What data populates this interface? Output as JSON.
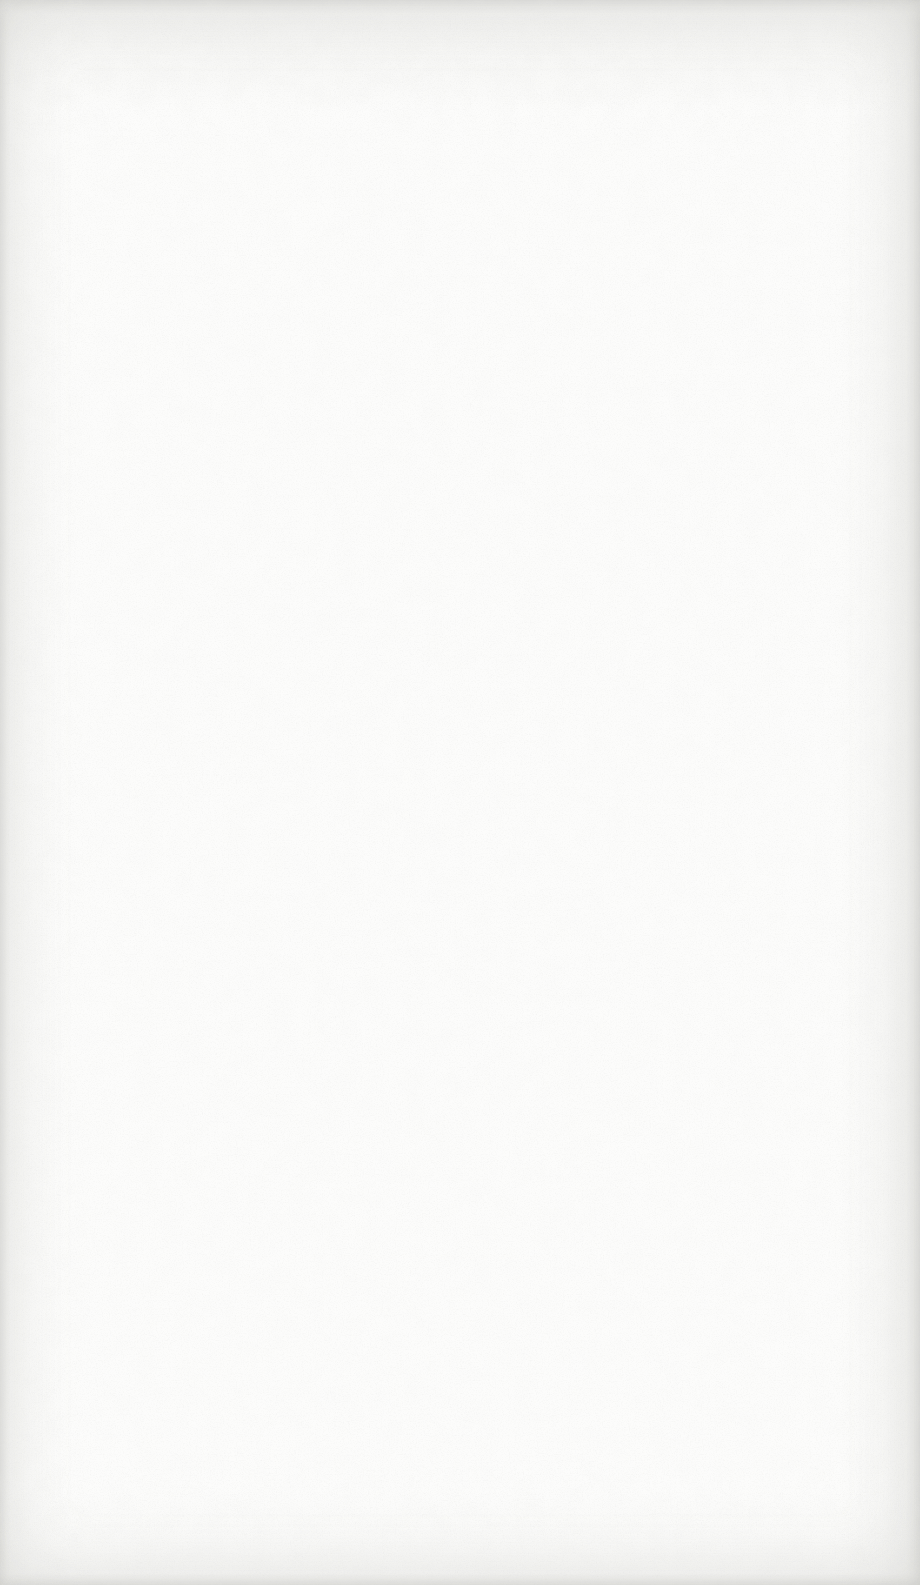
{
  "page": {
    "type": "blank-scanned-page",
    "visible_text": "",
    "colors": {
      "paper": "#fcfcfb",
      "edge": "#e5e5e2",
      "speckle": "#b9b9b5"
    }
  }
}
